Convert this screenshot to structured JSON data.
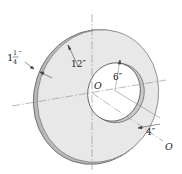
{
  "diagram": {
    "type": "engineering-figure",
    "labels": {
      "thickness_whole": "1",
      "thickness_num": "1",
      "thickness_den": "4",
      "thickness_unit": "″",
      "outer_radius": "12″",
      "hole_radius": "6″",
      "offset": "4″",
      "center_label": "O",
      "axis_label": "O"
    },
    "dimensions": {
      "thickness": "1 1/4 in",
      "outer_radius": "12 in",
      "hole_radius": "6 in",
      "hole_offset": "4 in"
    },
    "colors": {
      "disk_face": "#e6e6e6",
      "disk_edge": "#b5b5b5",
      "outline": "#555555",
      "axis": "#888888",
      "text": "#222222",
      "background": "#ffffff"
    }
  }
}
